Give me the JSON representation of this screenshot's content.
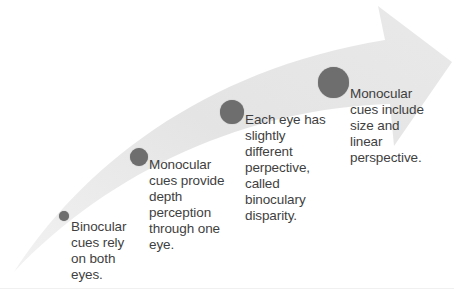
{
  "diagram": {
    "type": "curved-arrow-process",
    "colors": {
      "arrow_fill": "#e6e6e6",
      "dot_fill": "#6e6e6e",
      "text": "#3f3f3f",
      "background": "#ffffff"
    },
    "steps": [
      {
        "label": "Binocular cues rely on both eyes.",
        "lines": [
          "Binocular",
          "cues rely",
          "on both",
          "eyes."
        ]
      },
      {
        "label": "Monocular cues provide depth perception through one eye.",
        "lines": [
          "Monocular",
          "cues provide",
          "depth",
          "perception",
          "through one",
          "eye."
        ]
      },
      {
        "label": "Each eye has slightly different perpective, called binoculary disparity.",
        "lines": [
          "Each eye has",
          "slightly",
          "different",
          "perpective,",
          "called",
          "binoculary",
          "disparity."
        ]
      },
      {
        "label": "Monocular cues include size and linear perspective.",
        "lines": [
          "Monocular",
          "cues include",
          "size and",
          "linear",
          "perspective."
        ]
      }
    ]
  }
}
